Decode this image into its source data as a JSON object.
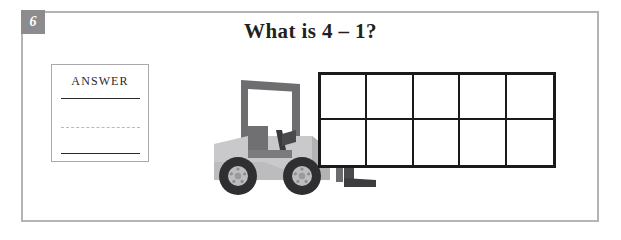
{
  "worksheet": {
    "question_number": "6",
    "title": "What is 4 – 1?",
    "background_color": "#ffffff",
    "frame_color": "#b4b4b6",
    "badge_color": "#8c8c8e",
    "badge_text_color": "#ffffff"
  },
  "answer_box": {
    "label": "ANSWER",
    "border_color": "#a9a9ab",
    "rules": [
      {
        "name": "top-rule",
        "style": "solid",
        "color": "#2b2b2b"
      },
      {
        "name": "middle-rule",
        "style": "dashed",
        "color": "#b9b9bb"
      },
      {
        "name": "bottom-rule",
        "style": "solid",
        "color": "#2b2b2b"
      }
    ]
  },
  "illustration": {
    "name": "forklift-illustration",
    "description": "grayscale forklift truck carrying a ten frame",
    "body_color": "#c9c9cb",
    "body_shade_color": "#b3b3b6",
    "cage_color": "#6e6e70",
    "seat_color": "#707072",
    "mast_color": "#4a4a4c",
    "tire_color": "#2f2f31",
    "hub_color": "#bdbdbf"
  },
  "ten_frame": {
    "name": "ten-frame",
    "rows": 2,
    "columns": 5,
    "border_color": "#1a1a1a",
    "cells": [
      {
        "index": 1,
        "filled": false
      },
      {
        "index": 2,
        "filled": false
      },
      {
        "index": 3,
        "filled": false
      },
      {
        "index": 4,
        "filled": false
      },
      {
        "index": 5,
        "filled": false
      },
      {
        "index": 6,
        "filled": false
      },
      {
        "index": 7,
        "filled": false
      },
      {
        "index": 8,
        "filled": false
      },
      {
        "index": 9,
        "filled": false
      },
      {
        "index": 10,
        "filled": false
      }
    ]
  }
}
